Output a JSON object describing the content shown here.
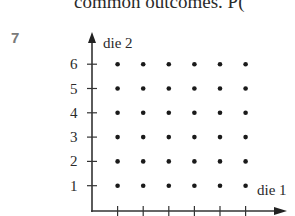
{
  "page": {
    "top_text": "common outcomes.   P(",
    "question_number": "7"
  },
  "chart_data": {
    "type": "scatter",
    "title": "",
    "xlabel": "die 1",
    "ylabel": "die 2",
    "y_ticks": [
      "1",
      "2",
      "3",
      "4",
      "5",
      "6"
    ],
    "x_ticks_labeled": false,
    "x_tick_count": 6,
    "xlim": [
      0,
      6.5
    ],
    "ylim": [
      0,
      6.5
    ],
    "grid": false,
    "points": [
      [
        1,
        1
      ],
      [
        2,
        1
      ],
      [
        3,
        1
      ],
      [
        4,
        1
      ],
      [
        5,
        1
      ],
      [
        6,
        1
      ],
      [
        1,
        2
      ],
      [
        2,
        2
      ],
      [
        3,
        2
      ],
      [
        4,
        2
      ],
      [
        5,
        2
      ],
      [
        6,
        2
      ],
      [
        1,
        3
      ],
      [
        2,
        3
      ],
      [
        3,
        3
      ],
      [
        4,
        3
      ],
      [
        5,
        3
      ],
      [
        6,
        3
      ],
      [
        1,
        4
      ],
      [
        2,
        4
      ],
      [
        3,
        4
      ],
      [
        4,
        4
      ],
      [
        5,
        4
      ],
      [
        6,
        4
      ],
      [
        1,
        5
      ],
      [
        2,
        5
      ],
      [
        3,
        5
      ],
      [
        4,
        5
      ],
      [
        5,
        5
      ],
      [
        6,
        5
      ],
      [
        1,
        6
      ],
      [
        2,
        6
      ],
      [
        3,
        6
      ],
      [
        4,
        6
      ],
      [
        5,
        6
      ],
      [
        6,
        6
      ]
    ]
  }
}
